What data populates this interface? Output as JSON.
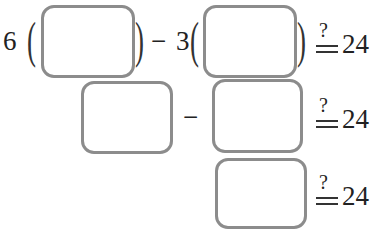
{
  "rows": [
    {
      "coef1": "6",
      "open": "(",
      "close": ")",
      "minus": "−",
      "coef2": "3",
      "eq_q": "?",
      "rhs": "24"
    },
    {
      "minus": "−",
      "eq_q": "?",
      "rhs": "24"
    },
    {
      "eq_q": "?",
      "rhs": "24"
    }
  ],
  "boxes": [
    "",
    "",
    "",
    "",
    ""
  ]
}
